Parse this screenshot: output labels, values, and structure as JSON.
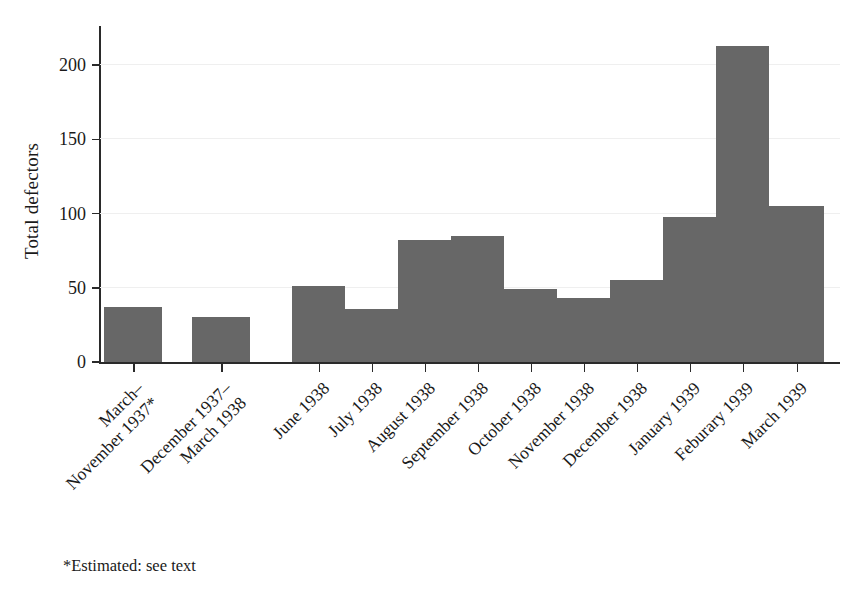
{
  "chart_data": {
    "type": "bar",
    "title": "",
    "xlabel": "",
    "ylabel": "Total defectors",
    "ylim": [
      0,
      225
    ],
    "yticks": [
      0,
      50,
      100,
      150,
      200
    ],
    "grid": true,
    "legend": null,
    "bar_color": "#676767",
    "categories": [
      "March–November 1937*",
      "December 1937–March 1938",
      "June 1938",
      "July 1938",
      "August 1938",
      "September 1938",
      "October 1938",
      "November 1938",
      "December 1938",
      "January 1939",
      "Feburary 1939",
      "March 1939"
    ],
    "category_lines": [
      [
        "March–",
        "November 1937*"
      ],
      [
        "December 1937–",
        "March 1938"
      ],
      [
        "June 1938"
      ],
      [
        "July 1938"
      ],
      [
        "August 1938"
      ],
      [
        "September 1938"
      ],
      [
        "October 1938"
      ],
      [
        "November 1938"
      ],
      [
        "December 1938"
      ],
      [
        "January 1939"
      ],
      [
        "Feburary 1939"
      ],
      [
        "March 1939"
      ]
    ],
    "values": [
      37,
      30,
      51,
      36,
      82,
      85,
      49,
      43,
      55,
      98,
      213,
      105
    ],
    "notes": "*Estimated: see text"
  },
  "footnote": "*Estimated: see text",
  "axis": {
    "y_title": "Total defectors"
  }
}
